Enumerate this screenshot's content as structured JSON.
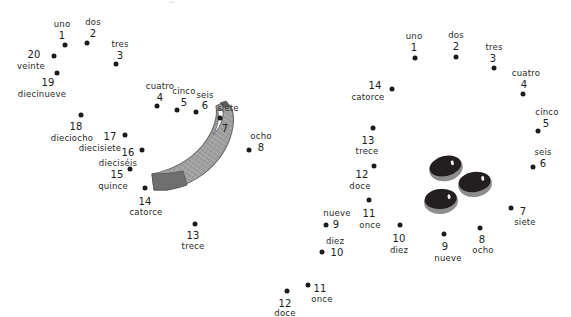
{
  "page": {
    "background_color": "#ffffff",
    "dot_color": "#1b1b1b",
    "text_color": "#1c1c1c",
    "artifact_mark": "—"
  },
  "puzzles": [
    {
      "id": "left-puzzle",
      "name": "banana-connect-the-dots",
      "art": {
        "name": "banana",
        "fill_light": "#b9b9b9",
        "fill_mid": "#9a9a9a",
        "fill_dark": "#6e6e6e",
        "outline": "#5a5a5a",
        "highlight": "#ffffff"
      },
      "dots": [
        {
          "n": "1",
          "word": "uno",
          "x": 65,
          "y": 45,
          "nx": 62,
          "ny": 35,
          "wx": 62,
          "wy": 24
        },
        {
          "n": "2",
          "word": "dos",
          "x": 87,
          "y": 43,
          "nx": 93,
          "ny": 33,
          "wx": 93,
          "wy": 22
        },
        {
          "n": "3",
          "word": "tres",
          "x": 116,
          "y": 64,
          "nx": 120,
          "ny": 55,
          "wx": 120,
          "wy": 44
        },
        {
          "n": "4",
          "word": "cuatro",
          "x": 157,
          "y": 106,
          "nx": 160,
          "ny": 97,
          "wx": 160,
          "wy": 86
        },
        {
          "n": "5",
          "word": "cinco",
          "x": 177,
          "y": 110,
          "nx": 184,
          "ny": 102,
          "wx": 184,
          "wy": 91
        },
        {
          "n": "6",
          "word": "seis",
          "x": 196,
          "y": 112,
          "nx": 205,
          "ny": 105,
          "wx": 205,
          "wy": 95
        },
        {
          "n": "7",
          "word": "siete",
          "x": 220,
          "y": 118,
          "nx": 225,
          "ny": 128,
          "wx": 228,
          "wy": 108
        },
        {
          "n": "8",
          "word": "ocho",
          "x": 249,
          "y": 150,
          "nx": 261,
          "ny": 147,
          "wx": 261,
          "wy": 136
        },
        {
          "n": "9",
          "word": "nueve",
          "x": 326,
          "y": 225,
          "nx": 336,
          "ny": 224,
          "wx": 337,
          "wy": 213
        },
        {
          "n": "10",
          "word": "diez",
          "x": 322,
          "y": 252,
          "nx": 337,
          "ny": 252,
          "wx": 335,
          "wy": 241
        },
        {
          "n": "11",
          "word": "once",
          "x": 308,
          "y": 285,
          "nx": 320,
          "ny": 288,
          "wx": 322,
          "wy": 299
        },
        {
          "n": "12",
          "word": "doce",
          "x": 287,
          "y": 291,
          "nx": 285,
          "ny": 303,
          "wx": 285,
          "wy": 313
        },
        {
          "n": "13",
          "word": "trece",
          "x": 195,
          "y": 224,
          "nx": 193,
          "ny": 235,
          "wx": 193,
          "wy": 246
        },
        {
          "n": "14",
          "word": "catorce",
          "x": 145,
          "y": 188,
          "nx": 145,
          "ny": 201,
          "wx": 146,
          "wy": 212
        },
        {
          "n": "15",
          "word": "quince",
          "x": 130,
          "y": 169,
          "nx": 117,
          "ny": 174,
          "wx": 113,
          "wy": 186
        },
        {
          "n": "16",
          "word": "dieciséis",
          "x": 142,
          "y": 150,
          "nx": 128,
          "ny": 152,
          "wx": 118,
          "wy": 163
        },
        {
          "n": "17",
          "word": "diecisiete",
          "x": 125,
          "y": 135,
          "nx": 110,
          "ny": 136,
          "wx": 100,
          "wy": 148
        },
        {
          "n": "18",
          "word": "dieciocho",
          "x": 81,
          "y": 115,
          "nx": 76,
          "ny": 126,
          "wx": 72,
          "wy": 138
        },
        {
          "n": "19",
          "word": "diecinueve",
          "x": 57,
          "y": 73,
          "nx": 48,
          "ny": 82,
          "wx": 42,
          "wy": 94
        },
        {
          "n": "20",
          "word": "veinte",
          "x": 54,
          "y": 56,
          "nx": 34,
          "ny": 54,
          "wx": 31,
          "wy": 66
        }
      ]
    },
    {
      "id": "right-puzzle",
      "name": "olives-connect-the-dots",
      "art": {
        "name": "three-olives",
        "fill_dark": "#231f20",
        "fill_mid": "#8d8d8d",
        "highlight": "#f2f2f2",
        "items": [
          {
            "x": 429,
            "y": 156,
            "w": 34,
            "h": 25,
            "rot": -14,
            "glint_x": 23,
            "glint_y": 6
          },
          {
            "x": 458,
            "y": 172,
            "w": 34,
            "h": 25,
            "rot": -8,
            "glint_x": 24,
            "glint_y": 5
          },
          {
            "x": 424,
            "y": 189,
            "w": 34,
            "h": 25,
            "rot": -6,
            "glint_x": 24,
            "glint_y": 6
          }
        ]
      },
      "dots": [
        {
          "n": "1",
          "word": "uno",
          "x": 415,
          "y": 58,
          "nx": 414,
          "ny": 47,
          "wx": 414,
          "wy": 36
        },
        {
          "n": "2",
          "word": "dos",
          "x": 456,
          "y": 57,
          "nx": 456,
          "ny": 46,
          "wx": 456,
          "wy": 35
        },
        {
          "n": "3",
          "word": "tres",
          "x": 494,
          "y": 68,
          "nx": 493,
          "ny": 58,
          "wx": 494,
          "wy": 47
        },
        {
          "n": "4",
          "word": "cuatro",
          "x": 523,
          "y": 94,
          "nx": 524,
          "ny": 84,
          "wx": 526,
          "wy": 73
        },
        {
          "n": "5",
          "word": "cinco",
          "x": 538,
          "y": 131,
          "nx": 546,
          "ny": 123,
          "wx": 547,
          "wy": 112
        },
        {
          "n": "6",
          "word": "seis",
          "x": 533,
          "y": 167,
          "nx": 543,
          "ny": 163,
          "wx": 543,
          "wy": 152
        },
        {
          "n": "7",
          "word": "siete",
          "x": 511,
          "y": 208,
          "nx": 523,
          "ny": 211,
          "wx": 525,
          "wy": 222
        },
        {
          "n": "8",
          "word": "ocho",
          "x": 480,
          "y": 228,
          "nx": 482,
          "ny": 239,
          "wx": 483,
          "wy": 250
        },
        {
          "n": "9",
          "word": "nueve",
          "x": 444,
          "y": 234,
          "nx": 445,
          "ny": 246,
          "wx": 448,
          "wy": 258
        },
        {
          "n": "10",
          "word": "diez",
          "x": 400,
          "y": 225,
          "nx": 399,
          "ny": 238,
          "wx": 399,
          "wy": 250
        },
        {
          "n": "11",
          "word": "once",
          "x": 369,
          "y": 200,
          "nx": 369,
          "ny": 213,
          "wx": 370,
          "wy": 225
        },
        {
          "n": "12",
          "word": "doce",
          "x": 374,
          "y": 166,
          "nx": 362,
          "ny": 174,
          "wx": 360,
          "wy": 186
        },
        {
          "n": "13",
          "word": "trece",
          "x": 373,
          "y": 128,
          "nx": 368,
          "ny": 140,
          "wx": 367,
          "wy": 151
        },
        {
          "n": "14",
          "word": "catorce",
          "x": 392,
          "y": 89,
          "nx": 375,
          "ny": 85,
          "wx": 368,
          "wy": 97
        }
      ]
    }
  ]
}
